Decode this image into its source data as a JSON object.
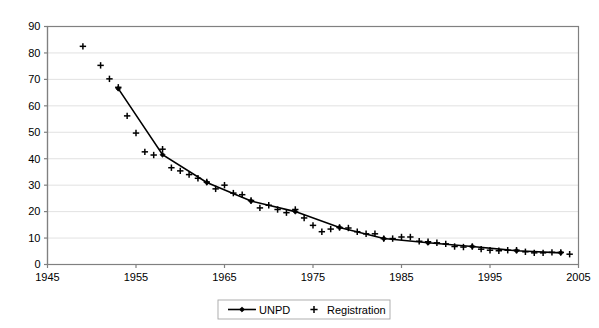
{
  "chart_data": {
    "type": "line",
    "title": "",
    "subtitle": "",
    "xlabel": "",
    "ylabel": "",
    "xlim": [
      1945,
      2005
    ],
    "ylim": [
      0,
      90
    ],
    "xticks": [
      1945,
      1955,
      1965,
      1975,
      1985,
      1995,
      2005
    ],
    "yticks": [
      0,
      10,
      20,
      30,
      40,
      50,
      60,
      70,
      80,
      90
    ],
    "grid": "horizontal",
    "legend_position": "bottom",
    "series": [
      {
        "name": "UNPD",
        "marker": "diamond",
        "line": "solid",
        "color": "#000000",
        "points": [
          {
            "x": 1953,
            "y": 66.5
          },
          {
            "x": 1958,
            "y": 41.5
          },
          {
            "x": 1963,
            "y": 31.0
          },
          {
            "x": 1968,
            "y": 24.0
          },
          {
            "x": 1973,
            "y": 20.0
          },
          {
            "x": 1978,
            "y": 14.0
          },
          {
            "x": 1983,
            "y": 9.8
          },
          {
            "x": 1988,
            "y": 8.2
          },
          {
            "x": 1993,
            "y": 6.8
          },
          {
            "x": 1998,
            "y": 5.2
          },
          {
            "x": 2003,
            "y": 4.4
          }
        ]
      },
      {
        "name": "Registration",
        "marker": "plus",
        "line": "none",
        "color": "#000000",
        "points": [
          {
            "x": 1949,
            "y": 82.5
          },
          {
            "x": 1951,
            "y": 75.3
          },
          {
            "x": 1952,
            "y": 70.2
          },
          {
            "x": 1953,
            "y": 67.0
          },
          {
            "x": 1954,
            "y": 56.2
          },
          {
            "x": 1955,
            "y": 49.7
          },
          {
            "x": 1956,
            "y": 42.6
          },
          {
            "x": 1957,
            "y": 41.4
          },
          {
            "x": 1958,
            "y": 43.6
          },
          {
            "x": 1959,
            "y": 36.6
          },
          {
            "x": 1960,
            "y": 35.4
          },
          {
            "x": 1961,
            "y": 34.0
          },
          {
            "x": 1962,
            "y": 32.6
          },
          {
            "x": 1963,
            "y": 31.2
          },
          {
            "x": 1964,
            "y": 28.6
          },
          {
            "x": 1965,
            "y": 30.0
          },
          {
            "x": 1966,
            "y": 27.0
          },
          {
            "x": 1967,
            "y": 26.4
          },
          {
            "x": 1968,
            "y": 24.2
          },
          {
            "x": 1969,
            "y": 21.4
          },
          {
            "x": 1970,
            "y": 22.4
          },
          {
            "x": 1971,
            "y": 20.8
          },
          {
            "x": 1972,
            "y": 19.6
          },
          {
            "x": 1973,
            "y": 20.8
          },
          {
            "x": 1974,
            "y": 17.6
          },
          {
            "x": 1975,
            "y": 14.8
          },
          {
            "x": 1976,
            "y": 12.4
          },
          {
            "x": 1977,
            "y": 13.4
          },
          {
            "x": 1978,
            "y": 14.0
          },
          {
            "x": 1979,
            "y": 13.8
          },
          {
            "x": 1980,
            "y": 12.4
          },
          {
            "x": 1981,
            "y": 11.6
          },
          {
            "x": 1982,
            "y": 11.6
          },
          {
            "x": 1983,
            "y": 9.8
          },
          {
            "x": 1984,
            "y": 9.8
          },
          {
            "x": 1985,
            "y": 10.4
          },
          {
            "x": 1986,
            "y": 10.4
          },
          {
            "x": 1987,
            "y": 8.8
          },
          {
            "x": 1988,
            "y": 8.6
          },
          {
            "x": 1989,
            "y": 8.2
          },
          {
            "x": 1990,
            "y": 7.8
          },
          {
            "x": 1991,
            "y": 6.8
          },
          {
            "x": 1992,
            "y": 6.6
          },
          {
            "x": 1993,
            "y": 6.8
          },
          {
            "x": 1994,
            "y": 5.8
          },
          {
            "x": 1995,
            "y": 5.4
          },
          {
            "x": 1996,
            "y": 5.2
          },
          {
            "x": 1997,
            "y": 5.4
          },
          {
            "x": 1998,
            "y": 5.4
          },
          {
            "x": 1999,
            "y": 4.8
          },
          {
            "x": 2000,
            "y": 4.4
          },
          {
            "x": 2001,
            "y": 4.4
          },
          {
            "x": 2002,
            "y": 4.6
          },
          {
            "x": 2003,
            "y": 4.6
          },
          {
            "x": 2004,
            "y": 3.9
          }
        ]
      }
    ]
  },
  "legend": {
    "entries": [
      {
        "label": "UNPD",
        "marker": "diamond-line"
      },
      {
        "label": "Registration",
        "marker": "plus"
      }
    ]
  }
}
